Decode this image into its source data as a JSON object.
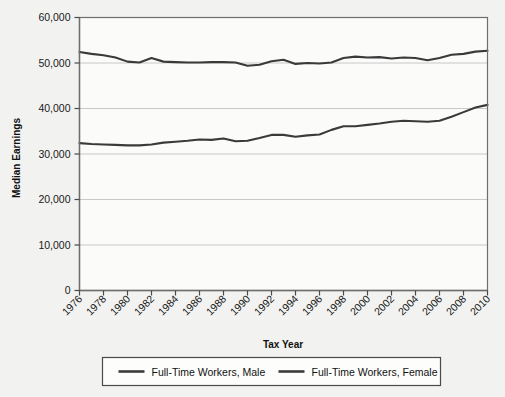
{
  "chart_data": {
    "type": "line",
    "title": "",
    "xlabel": "Tax Year",
    "ylabel": "Median Earnings",
    "xlim": [
      1976,
      2010
    ],
    "ylim": [
      0,
      60000
    ],
    "grid": true,
    "legend_position": "bottom",
    "ytick_labels": [
      "60,000",
      "50,000",
      "40,000",
      "30,000",
      "20,000",
      "10,000",
      "0"
    ],
    "ytick_values": [
      60000,
      50000,
      40000,
      30000,
      20000,
      10000,
      0
    ],
    "xtick_labels": [
      "1976",
      "1978",
      "1980",
      "1982",
      "1984",
      "1986",
      "1988",
      "1990",
      "1992",
      "1994",
      "1996",
      "1998",
      "2000",
      "2002",
      "2004",
      "2006",
      "2008",
      "2010"
    ],
    "xtick_values": [
      1976,
      1978,
      1980,
      1982,
      1984,
      1986,
      1988,
      1990,
      1992,
      1994,
      1996,
      1998,
      2000,
      2002,
      2004,
      2006,
      2008,
      2010
    ],
    "x": [
      1976,
      1977,
      1978,
      1979,
      1980,
      1981,
      1982,
      1983,
      1984,
      1985,
      1986,
      1987,
      1988,
      1989,
      1990,
      1991,
      1992,
      1993,
      1994,
      1995,
      1996,
      1997,
      1998,
      1999,
      2000,
      2001,
      2002,
      2003,
      2004,
      2005,
      2006,
      2007,
      2008,
      2009,
      2010
    ],
    "series": [
      {
        "name": "Full-Time Workers, Male",
        "color": "#3a3a3a",
        "values": [
          52400,
          52000,
          51700,
          51200,
          50300,
          50100,
          51100,
          50300,
          50200,
          50100,
          50100,
          50200,
          50200,
          50100,
          49400,
          49600,
          50400,
          50700,
          49800,
          50000,
          49900,
          50100,
          51100,
          51400,
          51200,
          51300,
          51000,
          51200,
          51100,
          50600,
          51100,
          51800,
          52000,
          52500,
          52700
        ]
      },
      {
        "name": "Full-Time Workers, Female",
        "color": "#3a3a3a",
        "values": [
          32400,
          32200,
          32100,
          32000,
          31900,
          31900,
          32100,
          32500,
          32700,
          32900,
          33200,
          33100,
          33400,
          32800,
          32900,
          33500,
          34200,
          34200,
          33800,
          34100,
          34300,
          35300,
          36100,
          36100,
          36400,
          36700,
          37100,
          37300,
          37200,
          37100,
          37300,
          38200,
          39200,
          40200,
          40800
        ]
      }
    ]
  },
  "legend": {
    "entries": [
      {
        "label": "Full-Time Workers, Male"
      },
      {
        "label": "Full-Time Workers, Female"
      }
    ]
  },
  "axes": {
    "y_title": "Median Earnings",
    "x_title": "Tax Year"
  }
}
